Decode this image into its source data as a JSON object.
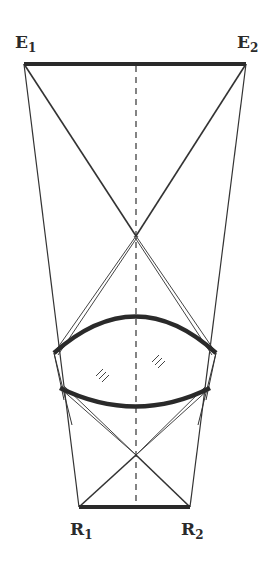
{
  "labels": {
    "e1": {
      "main": "E",
      "sub": "1"
    },
    "e2": {
      "main": "E",
      "sub": "2"
    },
    "r1": {
      "main": "R",
      "sub": "1"
    },
    "r2": {
      "main": "R",
      "sub": "2"
    }
  },
  "colors": {
    "line": "#2a2a2a",
    "background": "#ffffff"
  }
}
